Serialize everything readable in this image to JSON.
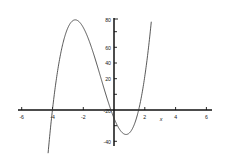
{
  "chart_data": {
    "type": "line",
    "title": "",
    "subtitle": "",
    "xlabel": "x",
    "ylabel": "",
    "xlim": [
      -6,
      6
    ],
    "ylim": [
      -40,
      80
    ],
    "grid": false,
    "legend": null,
    "x_ticks": [
      -6,
      -4,
      -2,
      2,
      4,
      6
    ],
    "x_tick_labels": [
      "-6",
      "-4",
      "-2",
      "2",
      "4",
      "6"
    ],
    "y_ticks": [
      -40,
      -20,
      20,
      40,
      60,
      80
    ],
    "y_tick_labels": [
      "-40",
      "-20",
      "20",
      "40",
      "60",
      "80"
    ],
    "series": [
      {
        "name": "cubic",
        "color": "#3a3a3a",
        "roots": [
          -4,
          -0.2,
          1.6
        ],
        "local_max": {
          "x": -2.3,
          "y": 78
        },
        "local_min": {
          "x": 0.9,
          "y": -22
        },
        "x": [
          -4.35,
          -4.2,
          -4.0,
          -3.8,
          -3.6,
          -3.4,
          -3.2,
          -3.0,
          -2.8,
          -2.6,
          -2.4,
          -2.2,
          -2.0,
          -1.8,
          -1.6,
          -1.4,
          -1.2,
          -1.0,
          -0.8,
          -0.6,
          -0.4,
          -0.2,
          0.0,
          0.2,
          0.4,
          0.6,
          0.8,
          1.0,
          1.2,
          1.4,
          1.6,
          1.8,
          2.0,
          2.2,
          2.35
        ],
        "y": [
          -38.7,
          -26.1,
          -11.2,
          1.4,
          11.9,
          20.4,
          27.2,
          32.4,
          36.1,
          38.5,
          39.8,
          40.0,
          39.2,
          37.6,
          35.2,
          32.2,
          28.6,
          24.5,
          20.1,
          15.4,
          10.5,
          5.5,
          0.5,
          -4.5,
          -9.3,
          -13.8,
          -17.9,
          -21.5,
          -24.4,
          -26.5,
          -27.6,
          -27.6,
          -26.3,
          -23.6,
          -20.9
        ]
      }
    ],
    "curve_equation_scaled": "y = 5(x+4)(x+0.2)(x-1.6)"
  },
  "axes": {
    "x_axis_name": "x-axis",
    "y_axis_name": "y-axis",
    "x_label_text": "x"
  }
}
